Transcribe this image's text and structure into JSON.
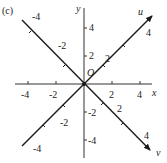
{
  "figure": {
    "panel_label": "(c)",
    "origin_label": "O",
    "axes": {
      "x": {
        "label": "x",
        "ticks": [
          "-4",
          "-2",
          "2",
          "4"
        ]
      },
      "y": {
        "label": "y",
        "ticks": [
          "4",
          "2",
          "-2",
          "-4"
        ]
      },
      "u": {
        "label": "u",
        "ticks": [
          "-4",
          "-2",
          "2",
          "4"
        ]
      },
      "v": {
        "label": "v",
        "ticks": [
          "-4",
          "-2",
          "2",
          "4"
        ]
      }
    },
    "colors": {
      "line": "#1a1a1a",
      "axis": "#333333",
      "text": "#222222"
    }
  }
}
